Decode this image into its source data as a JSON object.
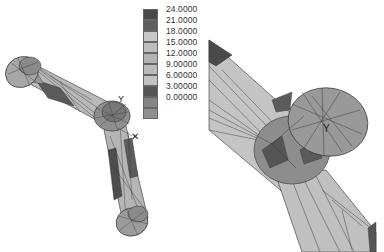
{
  "legend": {
    "title": "",
    "items": [
      {
        "label": "24.0000",
        "color": "#4a4a4a"
      },
      {
        "label": "21.0000",
        "color": "#5e5e5e"
      },
      {
        "label": "18.0000",
        "color": "#c8c8c8"
      },
      {
        "label": "15.0000",
        "color": "#bdbdbd"
      },
      {
        "label": "12.0000",
        "color": "#b3b3b3"
      },
      {
        "label": "9.00000",
        "color": "#bababa"
      },
      {
        "label": "6.00000",
        "color": "#c2c2c2"
      },
      {
        "label": "3.00000",
        "color": "#555555"
      },
      {
        "label": "0.00000",
        "color": "#858585"
      },
      {
        "label": "",
        "color": "#8f8f8f"
      }
    ]
  },
  "views": {
    "left": {
      "name": "full-model-view",
      "description": "Bent link (two straight arms with three cylindrical bosses), mesh shown with stress contours"
    },
    "right": {
      "name": "zoomed-joint-view",
      "description": "Close-up of middle joint boss with mesh"
    }
  },
  "markers": {
    "axis_glyph": "Y",
    "load_glyph": "✕"
  }
}
